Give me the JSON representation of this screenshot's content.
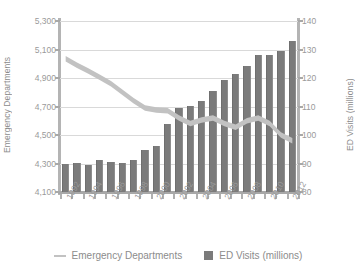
{
  "chart_data": {
    "type": "bar",
    "title": "",
    "subtitle": "",
    "xlabel": "",
    "ylabel": "Emergency Departments",
    "y2label": "ED Visits (millions)",
    "grid": true,
    "legend_position": "bottom",
    "ylim": [
      4100,
      5300
    ],
    "y2lim": [
      80,
      140
    ],
    "yticks": [
      "5,300",
      "5,100",
      "4,900",
      "4,700",
      "4,500",
      "4,300",
      "4,100"
    ],
    "ytick_values": [
      5300,
      5100,
      4900,
      4700,
      4500,
      4300,
      4100
    ],
    "y2ticks": [
      "140",
      "130",
      "120",
      "110",
      "100",
      "90",
      "80"
    ],
    "y2tick_values": [
      140,
      130,
      120,
      110,
      100,
      90,
      80
    ],
    "categories": [
      "1992",
      "1993",
      "1994",
      "1995",
      "1996",
      "1997",
      "1998",
      "1999",
      "2000",
      "2001",
      "2002",
      "2003",
      "2004",
      "2005",
      "2006",
      "2007",
      "2008",
      "2009",
      "2010",
      "2011",
      "2012"
    ],
    "xtick_labels": [
      "1992",
      "",
      "1994",
      "",
      "1996",
      "",
      "1998",
      "",
      "2000",
      "",
      "2002",
      "",
      "2004",
      "",
      "2006",
      "",
      "2008",
      "",
      "2010",
      "",
      "2012"
    ],
    "xtick_labels_shown": [
      "1992",
      "1994",
      "1996",
      "1998",
      "2000",
      "2002",
      "2004",
      "2006",
      "2008",
      "2010",
      "2012"
    ],
    "series": [
      {
        "name": "ED Visits (millions)",
        "type": "bar",
        "axis": "right",
        "color": "#7b7b7b",
        "values": [
          89.8,
          90.3,
          89.6,
          91.1,
          90.4,
          90.3,
          91.1,
          94.9,
          96.0,
          103.8,
          109.5,
          110.2,
          112.0,
          115.3,
          119.2,
          121.5,
          124.3,
          128.0,
          128.0,
          129.6,
          133.0
        ]
      },
      {
        "name": "Emergency Departments",
        "type": "line",
        "axis": "left",
        "color": "#c2c2c2",
        "values": [
          5035,
          4990,
          4950,
          4905,
          4860,
          4800,
          4740,
          4690,
          4675,
          4670,
          4620,
          4580,
          4605,
          4620,
          4580,
          4555,
          4600,
          4620,
          4580,
          4500,
          4460
        ]
      }
    ],
    "legend": [
      {
        "label": "Emergency Departments",
        "marker": "line",
        "color": "#c2c2c2"
      },
      {
        "label": "ED Visits (millions)",
        "marker": "square",
        "color": "#7b7b7b"
      }
    ]
  },
  "colors": {
    "background": "#ffffff",
    "bar": "#7b7b7b",
    "line": "#c2c2c2",
    "grid": "#d9d9d9",
    "axis": "#b4b4b4",
    "text": "#8c8c8c"
  }
}
